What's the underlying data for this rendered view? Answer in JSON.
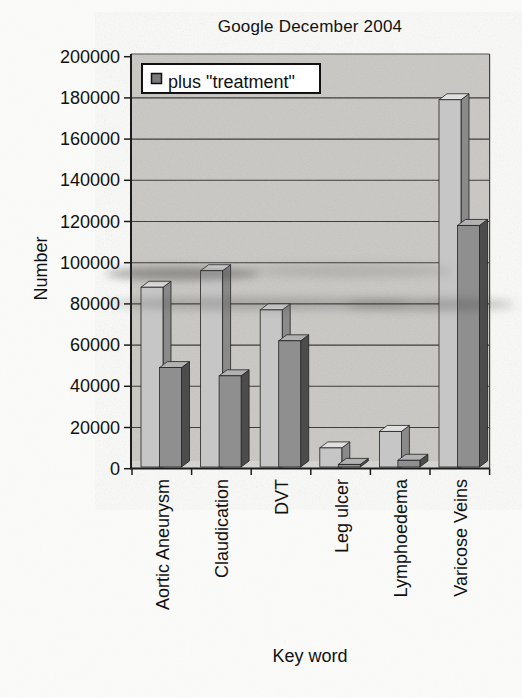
{
  "chart_data": {
    "type": "bar",
    "style": "3d-clustered-column, scanned grayscale figure",
    "title": "Google December 2004",
    "xlabel": "Key word",
    "ylabel": "Number",
    "ylim": [
      0,
      200000
    ],
    "ytick_step": 20000,
    "ytick_labels": [
      "0",
      "20000",
      "40000",
      "60000",
      "80000",
      "100000",
      "120000",
      "140000",
      "160000",
      "180000",
      "200000"
    ],
    "categories": [
      "Aortic Aneurysm",
      "Claudication",
      "DVT",
      "Leg ulcer",
      "Lymphoedema",
      "Varicose Veins"
    ],
    "series": [
      {
        "name": "",
        "in_legend": false,
        "shade": "light-gray",
        "values": [
          91000,
          99000,
          80000,
          13000,
          21000,
          182000
        ]
      },
      {
        "name": "plus \"treatment\"",
        "in_legend": true,
        "shade": "dark-gray",
        "values": [
          52000,
          48000,
          65000,
          5000,
          7000,
          121000
        ]
      }
    ],
    "legend": {
      "entries": [
        "plus \"treatment\""
      ],
      "position": "top-left",
      "marker_color": "#7a7a7a"
    },
    "grid": true,
    "colors": {
      "paper": "#fbfbf9",
      "wall": "#c9c8c4",
      "floor": "#d7d6d2",
      "gridline": "#333333",
      "axis": "#1c1c1c",
      "outline": "#222222",
      "series1_front": "#c6c6c6",
      "series1_top": "#e0e0e0",
      "series1_side": "#8a8a8a",
      "series2_front": "#8f8f8f",
      "series2_top": "#b2b2b2",
      "series2_side": "#4c4c4c",
      "legend_bg": "#ffffff"
    }
  }
}
